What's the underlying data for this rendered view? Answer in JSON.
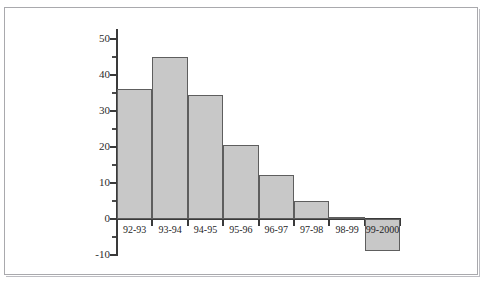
{
  "chart_data": {
    "type": "bar",
    "title": "",
    "subtitle": "",
    "xlabel": "",
    "ylabel": "",
    "categories": [
      "92-93",
      "93-94",
      "94-95",
      "95-96",
      "96-97",
      "97-98",
      "98-99",
      "99-2000"
    ],
    "values": [
      36,
      45,
      34.5,
      20.5,
      12.3,
      5,
      0,
      -9
    ],
    "ylim": [
      -10,
      50
    ],
    "ytick_labels": [
      "50",
      "40",
      "30",
      "20",
      "10",
      "0",
      "-10"
    ],
    "ytick_values": [
      50,
      40,
      30,
      20,
      10,
      0,
      -10
    ],
    "yminor_values": [
      45,
      35,
      25,
      15,
      5,
      -5
    ],
    "grid": false,
    "legend": null,
    "bar_fill_color": "#c8c8c8",
    "bar_border_color": "#5e5e5e",
    "axis_color": "#3a3a3a"
  },
  "frame": {
    "border_color": "#a9a9ad",
    "background_color": "#ffffff"
  }
}
